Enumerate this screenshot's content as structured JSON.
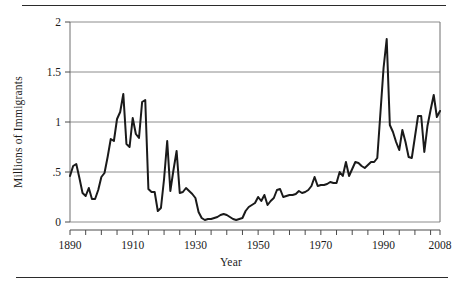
{
  "figure": {
    "name": "immigration-line-chart",
    "x_axis_title": "Year",
    "y_axis_title": "Millions of Immigrants"
  },
  "chart_data": {
    "type": "line",
    "title": "",
    "xlabel": "Year",
    "ylabel": "Millions of Immigrants",
    "xlim": [
      1890,
      2008
    ],
    "ylim": [
      0,
      2
    ],
    "grid": true,
    "legend": false,
    "line_color": "#1a1a1a",
    "grid_color": "#8c8c8c",
    "x_tick_labels": [
      "1890",
      "1910",
      "1930",
      "1950",
      "1970",
      "1990",
      "2008"
    ],
    "x_tick_values": [
      1890,
      1910,
      1930,
      1950,
      1970,
      1990,
      2008
    ],
    "x_minor_tick_step": 5,
    "y_tick_labels": [
      "0",
      ".5",
      "1",
      "1.5",
      "2"
    ],
    "y_tick_values": [
      0,
      0.5,
      1,
      1.5,
      2
    ],
    "series": [
      {
        "name": "Immigrants",
        "x": [
          1890,
          1891,
          1892,
          1893,
          1894,
          1895,
          1896,
          1897,
          1898,
          1899,
          1900,
          1901,
          1902,
          1903,
          1904,
          1905,
          1906,
          1907,
          1908,
          1909,
          1910,
          1911,
          1912,
          1913,
          1914,
          1915,
          1916,
          1917,
          1918,
          1919,
          1920,
          1921,
          1922,
          1923,
          1924,
          1925,
          1926,
          1927,
          1928,
          1929,
          1930,
          1931,
          1932,
          1933,
          1934,
          1935,
          1936,
          1937,
          1938,
          1939,
          1940,
          1941,
          1942,
          1943,
          1944,
          1945,
          1946,
          1947,
          1948,
          1949,
          1950,
          1951,
          1952,
          1953,
          1954,
          1955,
          1956,
          1957,
          1958,
          1959,
          1960,
          1961,
          1962,
          1963,
          1964,
          1965,
          1966,
          1967,
          1968,
          1969,
          1970,
          1971,
          1972,
          1973,
          1974,
          1975,
          1976,
          1977,
          1978,
          1979,
          1980,
          1981,
          1982,
          1983,
          1984,
          1985,
          1986,
          1987,
          1988,
          1989,
          1990,
          1991,
          1992,
          1993,
          1994,
          1995,
          1996,
          1997,
          1998,
          1999,
          2000,
          2001,
          2002,
          2003,
          2004,
          2005,
          2006,
          2007,
          2008
        ],
        "values": [
          0.46,
          0.56,
          0.58,
          0.44,
          0.29,
          0.26,
          0.34,
          0.23,
          0.23,
          0.32,
          0.45,
          0.49,
          0.65,
          0.83,
          0.81,
          1.03,
          1.1,
          1.28,
          0.78,
          0.75,
          1.04,
          0.88,
          0.84,
          1.2,
          1.22,
          0.33,
          0.3,
          0.3,
          0.11,
          0.14,
          0.43,
          0.81,
          0.31,
          0.52,
          0.71,
          0.29,
          0.3,
          0.34,
          0.31,
          0.28,
          0.24,
          0.1,
          0.04,
          0.02,
          0.03,
          0.03,
          0.04,
          0.05,
          0.07,
          0.08,
          0.07,
          0.05,
          0.03,
          0.02,
          0.03,
          0.04,
          0.11,
          0.15,
          0.17,
          0.19,
          0.25,
          0.21,
          0.27,
          0.17,
          0.21,
          0.24,
          0.32,
          0.33,
          0.25,
          0.26,
          0.27,
          0.27,
          0.28,
          0.31,
          0.29,
          0.3,
          0.32,
          0.36,
          0.45,
          0.36,
          0.37,
          0.37,
          0.38,
          0.4,
          0.39,
          0.39,
          0.5,
          0.46,
          0.6,
          0.46,
          0.53,
          0.6,
          0.59,
          0.56,
          0.54,
          0.57,
          0.6,
          0.6,
          0.64,
          1.09,
          1.54,
          1.83,
          0.97,
          0.9,
          0.8,
          0.72,
          0.92,
          0.8,
          0.65,
          0.64,
          0.85,
          1.06,
          1.06,
          0.7,
          0.96,
          1.12,
          1.27,
          1.05,
          1.11
        ]
      }
    ]
  }
}
